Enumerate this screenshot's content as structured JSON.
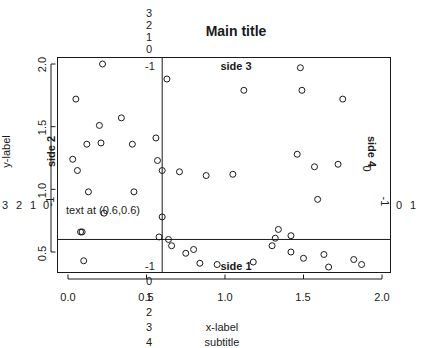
{
  "chart_data": {
    "type": "scatter",
    "title": "Main title",
    "subtitle": "subtitle",
    "xlabel": "x-label",
    "ylabel": "y-label",
    "xlim": [
      -0.07,
      2.07
    ],
    "ylim": [
      0.33,
      2.07
    ],
    "grid": false,
    "legend": null,
    "x_ticks": [
      "0.0",
      "0.5",
      "1.0",
      "1.5",
      "2.0"
    ],
    "x_tick_values": [
      0.0,
      0.5,
      1.0,
      1.5,
      2.0
    ],
    "y_ticks": [
      "0.5",
      "1.0",
      "1.5",
      "2.0"
    ],
    "y_tick_values": [
      0.5,
      1.0,
      1.5,
      2.0
    ],
    "point_symbol": "open-circle",
    "points": [
      [
        0.05,
        1.72
      ],
      [
        0.03,
        1.24
      ],
      [
        0.06,
        1.15
      ],
      [
        0.08,
        0.66
      ],
      [
        0.09,
        0.66
      ],
      [
        0.1,
        0.43
      ],
      [
        0.12,
        1.36
      ],
      [
        0.13,
        0.98
      ],
      [
        0.2,
        1.51
      ],
      [
        0.22,
        2.0
      ],
      [
        0.23,
        0.81
      ],
      [
        0.21,
        1.37
      ],
      [
        0.34,
        1.57
      ],
      [
        0.41,
        1.36
      ],
      [
        0.42,
        0.98
      ],
      [
        0.56,
        1.41
      ],
      [
        0.58,
        0.62
      ],
      [
        0.57,
        1.23
      ],
      [
        0.6,
        1.15
      ],
      [
        0.6,
        0.78
      ],
      [
        0.63,
        1.88
      ],
      [
        0.64,
        0.6
      ],
      [
        0.66,
        0.55
      ],
      [
        0.71,
        1.14
      ],
      [
        0.75,
        0.49
      ],
      [
        0.8,
        0.52
      ],
      [
        0.84,
        0.41
      ],
      [
        0.88,
        1.11
      ],
      [
        0.95,
        0.4
      ],
      [
        1.05,
        1.12
      ],
      [
        1.12,
        1.79
      ],
      [
        1.18,
        0.42
      ],
      [
        1.3,
        0.55
      ],
      [
        1.32,
        0.61
      ],
      [
        1.34,
        0.68
      ],
      [
        1.42,
        0.63
      ],
      [
        1.42,
        0.5
      ],
      [
        1.46,
        1.28
      ],
      [
        1.48,
        1.97
      ],
      [
        1.49,
        1.79
      ],
      [
        1.5,
        0.45
      ],
      [
        1.57,
        1.18
      ],
      [
        1.59,
        0.92
      ],
      [
        1.63,
        0.48
      ],
      [
        1.66,
        0.38
      ],
      [
        1.72,
        1.2
      ],
      [
        1.75,
        1.72
      ],
      [
        1.82,
        0.44
      ],
      [
        1.87,
        0.4
      ]
    ],
    "annotations": [
      {
        "name": "crosshair-vline",
        "orientation": "vertical",
        "value": 0.6
      },
      {
        "name": "crosshair-hline",
        "orientation": "horizontal",
        "value": 0.6
      },
      {
        "name": "point-label",
        "text": "text at (0.6,0.6)",
        "x": 0.6,
        "y": 0.6
      }
    ]
  },
  "title": "Main title",
  "subtitle": "subtitle",
  "axes": {
    "xlabel": "x-label",
    "ylabel": "y-label",
    "x_ticks": [
      "0.0",
      "0.5",
      "1.0",
      "1.5",
      "2.0"
    ],
    "y_ticks": [
      "2.0",
      "1.5",
      "1.0",
      "0.5"
    ]
  },
  "annotation": {
    "point_text": "text at (0.6,0.6)"
  },
  "margin_labels": {
    "side1": "side 1",
    "side2": "side 2",
    "side3": "side 3",
    "side4": "side 4",
    "bottom_lines": [
      "-1",
      "0",
      "1",
      "2",
      "3",
      "4"
    ],
    "left_lines": [
      "-1",
      "0",
      "1",
      "2",
      "3"
    ],
    "top_lines": [
      "-1",
      "0",
      "1",
      "2",
      "3"
    ],
    "right_lines": [
      "-1",
      "0",
      "1"
    ]
  },
  "colors": {
    "ink": "#1a1a1a",
    "background": "#ffffff",
    "point_stroke": "#1a1a1a"
  }
}
